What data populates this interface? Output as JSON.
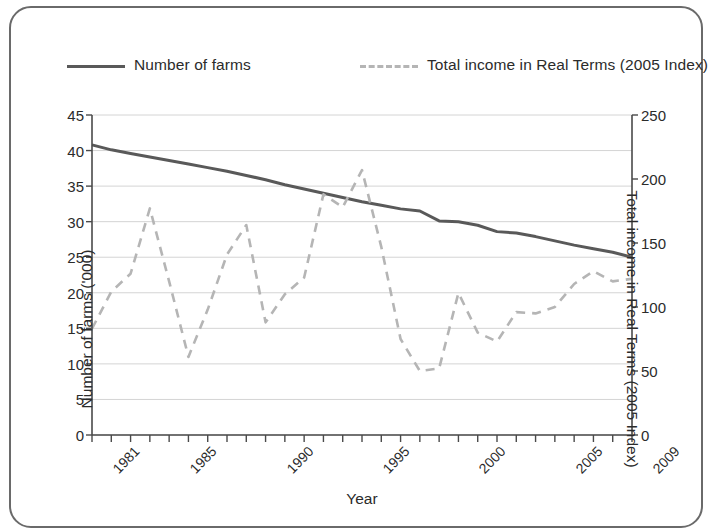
{
  "chart_data": {
    "type": "line",
    "title": "",
    "xlabel": "Year",
    "ylabel": "Number of farms ('000)",
    "y2label": "Total income in Real Terms (2005 Index)",
    "grid": true,
    "legend_position": "top",
    "xlim": [
      1981,
      2009
    ],
    "ylim": [
      0,
      45
    ],
    "y2lim": [
      0,
      250
    ],
    "y_ticks": [
      0,
      5,
      10,
      15,
      20,
      25,
      30,
      35,
      40,
      45
    ],
    "y2_ticks": [
      0,
      50,
      100,
      150,
      200,
      250
    ],
    "x_tick_labels": [
      "1981",
      "1985",
      "1990",
      "1995",
      "2000",
      "2005",
      "2009"
    ],
    "x_tick_label_years": [
      1981,
      1985,
      1990,
      1995,
      2000,
      2005,
      2009
    ],
    "x": [
      1981,
      1982,
      1983,
      1984,
      1985,
      1986,
      1987,
      1988,
      1989,
      1990,
      1991,
      1992,
      1993,
      1994,
      1995,
      1996,
      1997,
      1998,
      1999,
      2000,
      2001,
      2002,
      2003,
      2004,
      2005,
      2006,
      2007,
      2008,
      2009
    ],
    "series": [
      {
        "name": "Number of farms",
        "axis": "left",
        "style": "solid",
        "color": "#595959",
        "units": "'000",
        "values": [
          40.8,
          40.1,
          39.6,
          39.1,
          38.6,
          38.1,
          37.6,
          37.1,
          36.5,
          35.9,
          35.2,
          34.6,
          34.0,
          33.4,
          32.8,
          32.3,
          31.8,
          31.5,
          30.1,
          30.0,
          29.5,
          28.6,
          28.4,
          27.9,
          27.3,
          26.7,
          26.2,
          25.7,
          25.0
        ]
      },
      {
        "name": "Total income in Real Terms (2005 Index)",
        "axis": "right",
        "style": "dashed",
        "color": "#b5b5b5",
        "units": "2005 Index",
        "values": [
          83,
          112,
          126,
          177,
          120,
          61,
          98,
          141,
          164,
          88,
          110,
          123,
          188,
          178,
          207,
          147,
          75,
          50,
          52,
          111,
          80,
          73,
          96,
          95,
          100,
          118,
          128,
          120,
          122
        ]
      }
    ]
  },
  "legend": {
    "entries": [
      {
        "label": "Number of farms",
        "style": "solid",
        "color": "#595959"
      },
      {
        "label": "Total income in Real Terms (2005 Index)",
        "style": "dashed",
        "color": "#b5b5b5"
      }
    ]
  },
  "axes": {
    "left_title": "Number of farms ('000)",
    "right_title": "Total income in Real Terms (2005 Index)",
    "bottom_title": "Year"
  },
  "colors": {
    "frame": "#6a6a6a",
    "gridline": "#d4d4d4",
    "axis": "#4a4a4a",
    "text": "#2b2b2b",
    "series_solid": "#595959",
    "series_dashed": "#b5b5b5",
    "background": "#ffffff"
  }
}
